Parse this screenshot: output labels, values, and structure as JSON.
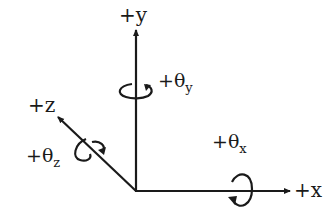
{
  "diagram": {
    "type": "coordinate-axes",
    "axes": [
      {
        "name": "x",
        "label": "+x",
        "rotation_label": "+θ",
        "rotation_sub": "x"
      },
      {
        "name": "y",
        "label": "+y",
        "rotation_label": "+θ",
        "rotation_sub": "y"
      },
      {
        "name": "z",
        "label": "+z",
        "rotation_label": "+θ",
        "rotation_sub": "z"
      }
    ],
    "colors": {
      "stroke": "#1a1a1a",
      "background": "#ffffff"
    }
  }
}
